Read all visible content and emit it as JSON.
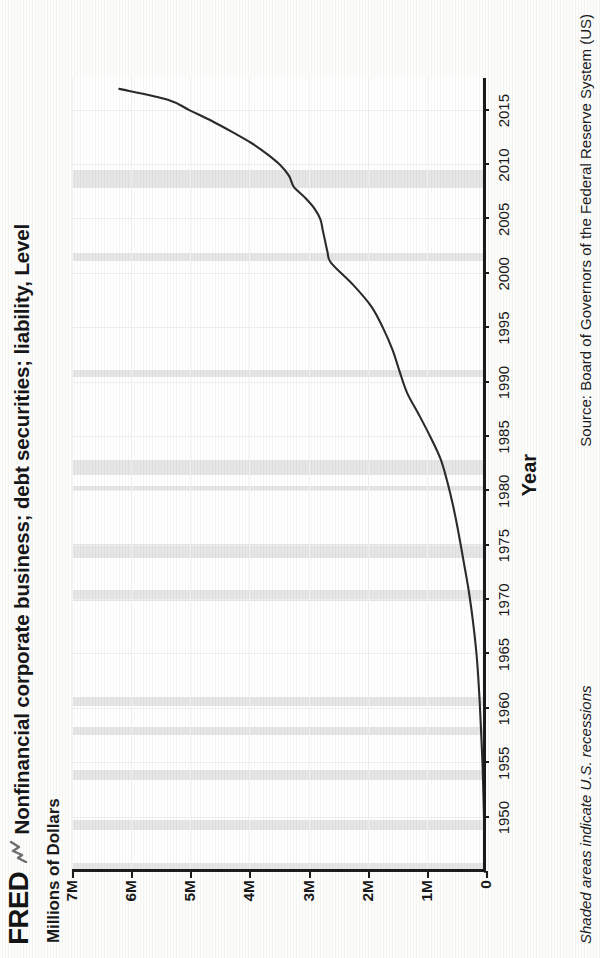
{
  "brand": {
    "name": "FRED",
    "mark_icon": "line-chart-mark-icon"
  },
  "header": {
    "title": "Nonfinancial corporate business; debt securities; liability, Level",
    "units": "Millions of Dollars"
  },
  "footer": {
    "shading_note": "Shaded areas indicate U.S. recessions",
    "source": "Source: Board of Governors of the Federal Reserve System (US)"
  },
  "chart_data": {
    "type": "line",
    "title": "Nonfinancial corporate business; debt securities; liability, Level",
    "xlabel": "Year",
    "ylabel": "Millions of Dollars",
    "xlim": [
      1945,
      2018
    ],
    "ylim": [
      0,
      7000000
    ],
    "grid": true,
    "legend": false,
    "xticks": [
      1950,
      1955,
      1960,
      1965,
      1970,
      1975,
      1980,
      1985,
      1990,
      1995,
      2000,
      2005,
      2010,
      2015
    ],
    "xtick_labels": [
      "1950",
      "1955",
      "1960",
      "1965",
      "1970",
      "1975",
      "1980",
      "1985",
      "1990",
      "1995",
      "2000",
      "2005",
      "2010",
      "2015"
    ],
    "yticks": [
      0,
      1000000,
      2000000,
      3000000,
      4000000,
      5000000,
      6000000,
      7000000
    ],
    "ytick_labels": [
      "0",
      "1M",
      "2M",
      "3M",
      "4M",
      "5M",
      "6M",
      "7M"
    ],
    "series": [
      {
        "name": "Nonfinancial corporate business; debt securities; liability, Level",
        "color": "#2b2b2b",
        "x": [
          1945,
          1947,
          1949,
          1951,
          1953,
          1955,
          1957,
          1959,
          1961,
          1963,
          1965,
          1967,
          1969,
          1971,
          1973,
          1975,
          1977,
          1979,
          1981,
          1983,
          1985,
          1987,
          1989,
          1991,
          1993,
          1995,
          1997,
          1999,
          2001,
          2002,
          2003,
          2004,
          2005,
          2006,
          2007,
          2008,
          2009,
          2010,
          2011,
          2012,
          2013,
          2014,
          2015,
          2016,
          2017
        ],
        "values": [
          18000,
          23000,
          29000,
          38000,
          48000,
          60000,
          75000,
          92000,
          110000,
          132000,
          160000,
          198000,
          243000,
          296000,
          360000,
          425000,
          493000,
          570000,
          660000,
          770000,
          940000,
          1130000,
          1330000,
          1460000,
          1580000,
          1740000,
          1940000,
          2250000,
          2620000,
          2680000,
          2720000,
          2760000,
          2800000,
          2900000,
          3060000,
          3250000,
          3330000,
          3480000,
          3700000,
          3960000,
          4280000,
          4620000,
          5000000,
          5380000,
          6200000
        ]
      }
    ],
    "recessions": [
      {
        "start": 1945.1,
        "end": 1945.8
      },
      {
        "start": 1948.9,
        "end": 1949.8
      },
      {
        "start": 1953.5,
        "end": 1954.4
      },
      {
        "start": 1957.6,
        "end": 1958.3
      },
      {
        "start": 1960.3,
        "end": 1961.1
      },
      {
        "start": 1969.9,
        "end": 1970.9
      },
      {
        "start": 1973.9,
        "end": 1975.2
      },
      {
        "start": 1980.0,
        "end": 1980.5
      },
      {
        "start": 1981.5,
        "end": 1982.9
      },
      {
        "start": 1990.5,
        "end": 1991.2
      },
      {
        "start": 2001.2,
        "end": 2001.9
      },
      {
        "start": 2007.9,
        "end": 2009.5
      }
    ],
    "shading_color": "#e4e4e4"
  }
}
